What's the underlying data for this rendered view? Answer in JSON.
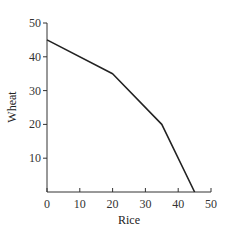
{
  "chart_data": {
    "type": "line",
    "title": "",
    "xlabel": "Rice",
    "ylabel": "Wheat",
    "xlim": [
      0,
      50
    ],
    "ylim": [
      0,
      50
    ],
    "xticks": [
      0,
      10,
      20,
      30,
      40,
      50
    ],
    "yticks": [
      10,
      20,
      30,
      40,
      50
    ],
    "grid": false,
    "legend": null,
    "series": [
      {
        "name": "Production possibilities frontier",
        "x": [
          0,
          20,
          35,
          45
        ],
        "y": [
          45,
          35,
          20,
          0
        ],
        "color": "#222222"
      }
    ]
  },
  "colors": {
    "axis": "#333333",
    "line": "#222222",
    "background": "#ffffff"
  }
}
